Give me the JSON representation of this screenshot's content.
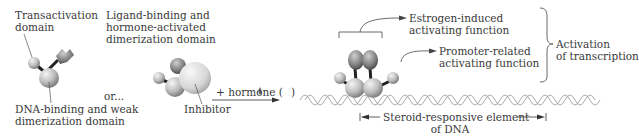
{
  "labels": {
    "transactivation": [
      "Transactivation",
      "domain"
    ],
    "ligand_binding": [
      "Ligand-binding and",
      "hormone-activated",
      "dimerization domain"
    ],
    "dna_binding": [
      "DNA-binding and weak",
      "dimerization domain"
    ],
    "or": "or...",
    "inhibitor": "Inhibitor",
    "plus_hormone": "+ hormone (",
    "plus_hormone_close": ")",
    "estrogen": [
      "Estrogen-induced",
      "activating function"
    ],
    "promoter": [
      "Promoter-related",
      "activating function"
    ],
    "activation": [
      "Activation",
      "of transcription"
    ],
    "steroid": [
      "Steroid-responsive element",
      "of DNA"
    ]
  },
  "colors": {
    "sphere_light": "#e6e6e6",
    "sphere_dark": "#8e8e8e",
    "dark_piece": "#5a5a5a",
    "line": "#444444",
    "dna": "#9a9a9a"
  }
}
